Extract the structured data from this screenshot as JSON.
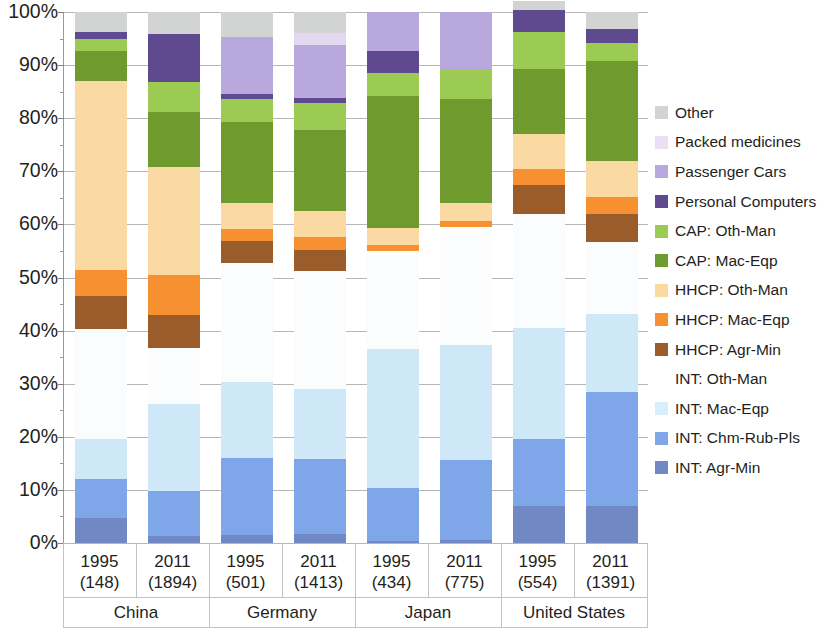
{
  "chart_data": {
    "type": "bar",
    "stacked": true,
    "normalized_percent": true,
    "title": "",
    "xlabel": "",
    "ylabel": "",
    "ylim": [
      0,
      100
    ],
    "ytick_labels": [
      "0%",
      "10%",
      "20%",
      "30%",
      "40%",
      "50%",
      "60%",
      "70%",
      "80%",
      "90%",
      "100%"
    ],
    "ytick_values": [
      0,
      10,
      20,
      30,
      40,
      50,
      60,
      70,
      80,
      90,
      100
    ],
    "grid": true,
    "legend_position": "right",
    "categories": [
      "1995\n(148)",
      "2011\n(1894)",
      "1995\n(501)",
      "2011\n(1413)",
      "1995\n(434)",
      "2011\n(775)",
      "1995\n(554)",
      "2011\n(1391)"
    ],
    "group_labels": [
      "China",
      "Germany",
      "Japan",
      "United States"
    ],
    "bars": [
      {
        "year": "1995",
        "value": "(148)",
        "country": "China"
      },
      {
        "year": "2011",
        "value": "(1894)",
        "country": "China"
      },
      {
        "year": "1995",
        "value": "(501)",
        "country": "Germany"
      },
      {
        "year": "2011",
        "value": "(1413)",
        "country": "Germany"
      },
      {
        "year": "1995",
        "value": "(434)",
        "country": "Japan"
      },
      {
        "year": "2011",
        "value": "(775)",
        "country": "Japan"
      },
      {
        "year": "1995",
        "value": "(554)",
        "country": "United States"
      },
      {
        "year": "2011",
        "value": "(1391)",
        "country": "United States"
      }
    ],
    "series": [
      {
        "name": "INT: Agr-Min",
        "color": "#7089c4",
        "values": [
          4.7,
          1.4,
          1.5,
          1.7,
          0.4,
          0.5,
          6.9,
          7.0
        ]
      },
      {
        "name": "INT: Chm-Rub-Pls",
        "color": "#7fa6e8",
        "values": [
          7.3,
          8.4,
          14.6,
          14.2,
          9.9,
          15.2,
          12.6,
          21.4
        ]
      },
      {
        "name": "INT: Mac-Eqp",
        "color": "#cfe8f7",
        "values": [
          7.6,
          16.4,
          14.2,
          13.1,
          26.2,
          21.6,
          21.0,
          14.7
        ]
      },
      {
        "name": "INT: Oth-Man",
        "color": "#fbfcfe",
        "values": [
          20.7,
          10.6,
          22.5,
          22.2,
          18.5,
          22.2,
          21.4,
          13.6
        ]
      },
      {
        "name": "HHCP: Agr-Min",
        "color": "#9a5c2b",
        "values": [
          6.2,
          6.2,
          4.0,
          4.0,
          0.0,
          0.0,
          5.6,
          5.3
        ]
      },
      {
        "name": "HHCP: Mac-Eqp",
        "color": "#f79030",
        "values": [
          5.0,
          7.5,
          2.3,
          2.5,
          1.2,
          1.2,
          2.9,
          3.2
        ]
      },
      {
        "name": "HHCP: Oth-Man",
        "color": "#fbd9a3",
        "values": [
          35.6,
          20.3,
          5.0,
          4.8,
          3.1,
          3.3,
          6.6,
          6.7
        ]
      },
      {
        "name": "CAP: Mac-Eqp",
        "color": "#6f9b2e",
        "values": [
          5.5,
          10.4,
          15.2,
          15.3,
          24.8,
          19.7,
          12.2,
          18.9
        ]
      },
      {
        "name": "CAP: Oth-Man",
        "color": "#9ccb54",
        "values": [
          2.3,
          5.7,
          4.3,
          5.0,
          4.5,
          5.5,
          7.1,
          3.4
        ]
      },
      {
        "name": "Personal Computers",
        "color": "#5f4a8f",
        "values": [
          1.3,
          8.9,
          1.0,
          1.0,
          4.0,
          0.0,
          4.1,
          2.6
        ]
      },
      {
        "name": "Passenger Cars",
        "color": "#b8a8dd",
        "values": [
          0.0,
          0.0,
          10.7,
          9.9,
          7.4,
          10.8,
          0.0,
          0.0
        ]
      },
      {
        "name": "Packed medicines",
        "color": "#e3d8f0",
        "values": [
          0.0,
          0.0,
          0.0,
          2.3,
          0.0,
          0.0,
          0.0,
          0.0
        ]
      },
      {
        "name": "Other",
        "color": "#d2d3d3",
        "values": [
          3.8,
          4.2,
          4.7,
          4.0,
          0.0,
          0.0,
          1.6,
          3.2
        ]
      }
    ],
    "stack_order_bottom_to_top": [
      "INT: Agr-Min",
      "INT: Chm-Rub-Pls",
      "INT: Mac-Eqp",
      "INT: Oth-Man",
      "HHCP: Agr-Min",
      "HHCP: Mac-Eqp",
      "HHCP: Oth-Man",
      "CAP: Mac-Eqp",
      "CAP: Oth-Man",
      "Personal Computers",
      "Passenger Cars",
      "Packed medicines",
      "Other"
    ]
  },
  "legend": {
    "items": [
      {
        "label": "Other",
        "color": "#d2d3d3"
      },
      {
        "label": "Packed medicines",
        "color": "#e9e1f3"
      },
      {
        "label": "Passenger Cars",
        "color": "#b8a8dd"
      },
      {
        "label": "Personal Computers",
        "color": "#5f4a8f"
      },
      {
        "label": "CAP: Oth-Man",
        "color": "#9ccb54"
      },
      {
        "label": "CAP: Mac-Eqp",
        "color": "#6f9b2e"
      },
      {
        "label": "HHCP: Oth-Man",
        "color": "#fbd9a3"
      },
      {
        "label": "HHCP: Mac-Eqp",
        "color": "#f79030"
      },
      {
        "label": "HHCP: Agr-Min",
        "color": "#9a5c2b"
      },
      {
        "label": "INT: Oth-Man",
        "color": "#fdfdfd"
      },
      {
        "label": "INT: Mac-Eqp",
        "color": "#d9eefb"
      },
      {
        "label": "INT: Chm-Rub-Pls",
        "color": "#7fa6e8"
      },
      {
        "label": "INT: Agr-Min",
        "color": "#7089c4"
      }
    ]
  },
  "yaxis": {
    "labels": [
      "100%",
      "90%",
      "80%",
      "70%",
      "60%",
      "50%",
      "40%",
      "30%",
      "20%",
      "10%",
      "0%"
    ]
  }
}
